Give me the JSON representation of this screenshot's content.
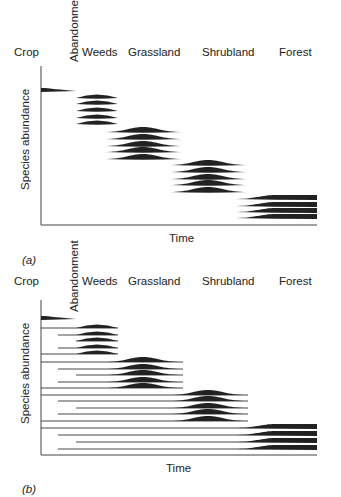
{
  "stages": [
    "Crop",
    "Abandonment",
    "Weeds",
    "Grassland",
    "Shrubland",
    "Forest"
  ],
  "panels": [
    {
      "id": "a",
      "label": "(a)",
      "ylabel": "Species abundance",
      "xlabel": "Time",
      "description": "Relay floristics: each successional stage's species appear and disappear in sequence"
    },
    {
      "id": "b",
      "label": "(b)",
      "ylabel": "Species abundance",
      "xlabel": "Time",
      "description": "Initial floristic composition: all species present from abandonment, dominant at different times"
    }
  ],
  "labels": {
    "crop": "Crop",
    "abandonment": "Abandonment",
    "weeds": "Weeds",
    "grassland": "Grassland",
    "shrubland": "Shrubland",
    "forest": "Forest",
    "time": "Time",
    "species_abundance": "Species abundance",
    "panel_a": "(a)",
    "panel_b": "(b)"
  },
  "colors": {
    "ink": "#222222",
    "background": "#ffffff"
  }
}
